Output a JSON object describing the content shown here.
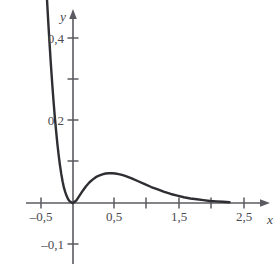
{
  "figure": {
    "kind": "function-graph",
    "background_color": "#ffffff",
    "curve_color": "#2e2e33",
    "axis_color": "#5a5a60",
    "label_color": "#4a4a50"
  },
  "axes": {
    "x_axis_name": "x",
    "y_axis_name": "y",
    "x_tick_labels": [
      {
        "value": -0.5,
        "text": "–0,5"
      },
      {
        "value": 0.5,
        "text": "0,5"
      },
      {
        "value": 1.5,
        "text": "1,5"
      },
      {
        "value": 2.5,
        "text": "2,5"
      }
    ],
    "x_unlabeled_ticks": [
      0.0,
      1.0,
      2.0
    ],
    "y_tick_labels": [
      {
        "value": 0.4,
        "text": "0,4"
      },
      {
        "value": 0.2,
        "text": "0,2"
      },
      {
        "value": -0.1,
        "text": "–0,1"
      }
    ],
    "y_unlabeled_ticks": [
      0.3,
      0.1
    ]
  },
  "chart_data": {
    "type": "line",
    "title": "",
    "xlabel": "x",
    "ylabel": "y",
    "xlim": [
      -0.55,
      2.75
    ],
    "ylim": [
      -0.13,
      0.5
    ],
    "grid": false,
    "legend": "none",
    "x_ticks": [
      -0.5,
      0.0,
      0.5,
      1.0,
      1.5,
      2.0,
      2.5
    ],
    "x_tick_labels": [
      "–0,5",
      "",
      "0,5",
      "",
      "1,5",
      "",
      "2,5"
    ],
    "y_ticks": [
      -0.1,
      0.1,
      0.2,
      0.3,
      0.4
    ],
    "y_tick_labels": [
      "–0,1",
      "",
      "0,2",
      "",
      "0,4"
    ],
    "series": [
      {
        "name": "f(x)",
        "x": [
          -0.42,
          -0.4,
          -0.38,
          -0.36,
          -0.34,
          -0.32,
          -0.3,
          -0.28,
          -0.26,
          -0.24,
          -0.22,
          -0.2,
          -0.18,
          -0.16,
          -0.14,
          -0.12,
          -0.1,
          -0.08,
          -0.06,
          -0.04,
          -0.02,
          0.0,
          0.05,
          0.1,
          0.15,
          0.2,
          0.25,
          0.3,
          0.35,
          0.4,
          0.45,
          0.5,
          0.55,
          0.6,
          0.65,
          0.7,
          0.75,
          0.8,
          0.9,
          1.0,
          1.1,
          1.2,
          1.3,
          1.4,
          1.5,
          1.6,
          1.7,
          1.8,
          1.9,
          2.0,
          2.1,
          2.2,
          2.3,
          2.4
        ],
        "y": [
          0.56,
          0.5,
          0.443,
          0.39,
          0.34,
          0.294,
          0.251,
          0.212,
          0.177,
          0.145,
          0.117,
          0.092,
          0.071,
          0.053,
          0.038,
          0.027,
          0.018,
          0.011,
          0.006,
          0.003,
          0.001,
          0.0,
          0.006,
          0.018,
          0.03,
          0.041,
          0.05,
          0.057,
          0.063,
          0.067,
          0.07,
          0.072,
          0.0725,
          0.0727,
          0.072,
          0.0705,
          0.0685,
          0.066,
          0.06,
          0.053,
          0.046,
          0.039,
          0.033,
          0.027,
          0.022,
          0.018,
          0.014,
          0.011,
          0.009,
          0.007,
          0.005,
          0.004,
          0.003,
          0.002
        ]
      }
    ],
    "annotations": {
      "local_minimum": {
        "x": 0.0,
        "y": 0.0
      },
      "local_maximum": {
        "x": 0.6,
        "y": 0.073
      },
      "behavior": "steep decay from upper-left to zero at origin, hump peaking near x=0,6, then asymptotic decay toward zero"
    }
  }
}
